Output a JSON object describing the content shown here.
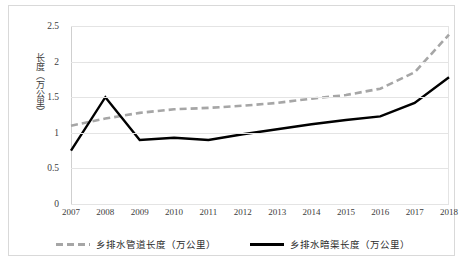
{
  "chart_data": {
    "type": "line",
    "title": "",
    "xlabel": "",
    "ylabel": "长度（万公里）",
    "ylim": [
      0,
      2.5
    ],
    "ytick_step": 0.5,
    "yticks": [
      "0",
      "0.5",
      "1",
      "1.5",
      "2",
      "2.5"
    ],
    "grid": true,
    "legend_position": "bottom",
    "categories": [
      "2007",
      "2008",
      "2009",
      "2010",
      "2011",
      "2012",
      "2013",
      "2014",
      "2015",
      "2016",
      "2017",
      "2018"
    ],
    "series": [
      {
        "name": "乡排水管道长度（万公里）",
        "style": "dashed",
        "color": "#a6a6a6",
        "values": [
          1.1,
          1.2,
          1.28,
          1.33,
          1.35,
          1.38,
          1.42,
          1.48,
          1.53,
          1.62,
          1.85,
          2.38
        ]
      },
      {
        "name": "乡排水暗渠长度（万公里）",
        "style": "solid",
        "color": "#000000",
        "values": [
          0.75,
          1.5,
          0.9,
          0.93,
          0.9,
          0.98,
          1.05,
          1.12,
          1.18,
          1.23,
          1.42,
          1.78
        ]
      }
    ]
  }
}
